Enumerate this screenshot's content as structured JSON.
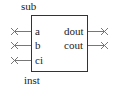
{
  "block": {
    "module_name": "sub",
    "instance_name": "inst",
    "inputs": [
      {
        "name": "a"
      },
      {
        "name": "b"
      },
      {
        "name": "ci"
      }
    ],
    "outputs": [
      {
        "name": "dout"
      },
      {
        "name": "cout"
      }
    ]
  }
}
